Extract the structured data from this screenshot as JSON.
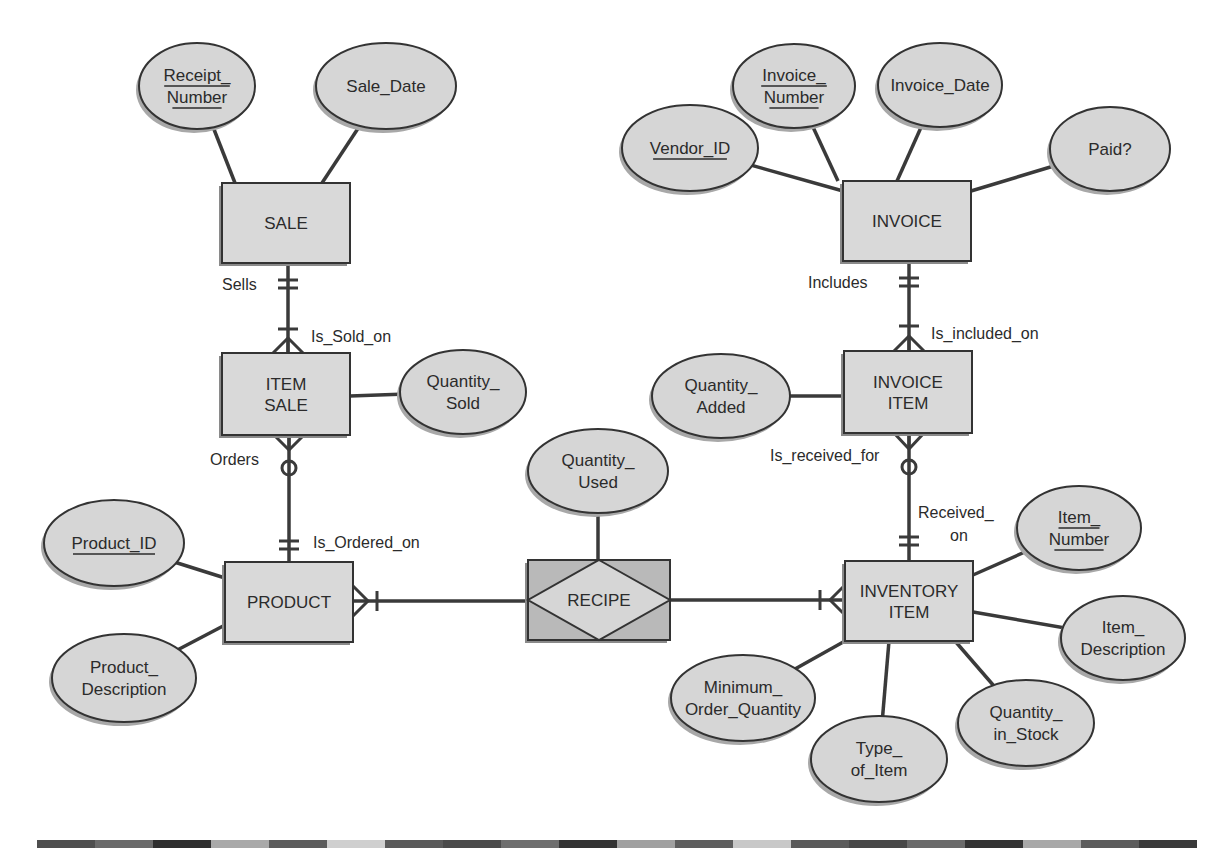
{
  "diagram": {
    "type": "entity-relationship",
    "entities": [
      {
        "id": "sale",
        "label": "SALE",
        "lines": [
          "SALE"
        ],
        "x": 222,
        "y": 183,
        "w": 128,
        "h": 80
      },
      {
        "id": "item_sale",
        "label": "ITEM SALE",
        "lines": [
          "ITEM",
          "SALE"
        ],
        "x": 222,
        "y": 353,
        "w": 128,
        "h": 82
      },
      {
        "id": "product",
        "label": "PRODUCT",
        "lines": [
          "PRODUCT"
        ],
        "x": 225,
        "y": 562,
        "w": 128,
        "h": 80
      },
      {
        "id": "invoice",
        "label": "INVOICE",
        "lines": [
          "INVOICE"
        ],
        "x": 843,
        "y": 181,
        "w": 128,
        "h": 80
      },
      {
        "id": "invoice_item",
        "label": "INVOICE ITEM",
        "lines": [
          "INVOICE",
          "ITEM"
        ],
        "x": 844,
        "y": 351,
        "w": 128,
        "h": 82
      },
      {
        "id": "inventory_item",
        "label": "INVENTORY ITEM",
        "lines": [
          "INVENTORY",
          "ITEM"
        ],
        "x": 845,
        "y": 561,
        "w": 128,
        "h": 80
      }
    ],
    "associative_entity": {
      "id": "recipe",
      "label": "RECIPE",
      "x": 528,
      "y": 560,
      "w": 142,
      "h": 80
    },
    "attributes": [
      {
        "id": "receipt_number",
        "lines": [
          "Receipt_",
          "Number"
        ],
        "key": true,
        "cx": 197,
        "cy": 86,
        "rx": 58,
        "ry": 43,
        "connects": "sale",
        "lx": 235,
        "ly": 183
      },
      {
        "id": "sale_date",
        "lines": [
          "Sale_Date"
        ],
        "key": false,
        "cx": 386,
        "cy": 86,
        "rx": 70,
        "ry": 43,
        "connects": "sale",
        "lx": 322,
        "ly": 183
      },
      {
        "id": "quantity_sold",
        "lines": [
          "Quantity_",
          "Sold"
        ],
        "key": false,
        "cx": 463,
        "cy": 392,
        "rx": 63,
        "ry": 42,
        "connects": "item_sale",
        "lx": 350,
        "ly": 396
      },
      {
        "id": "product_id",
        "lines": [
          "Product_ID"
        ],
        "key": true,
        "cx": 114,
        "cy": 543,
        "rx": 70,
        "ry": 43,
        "connects": "product",
        "lx": 225,
        "ly": 578
      },
      {
        "id": "product_description",
        "lines": [
          "Product_",
          "Description"
        ],
        "key": false,
        "cx": 124,
        "cy": 678,
        "rx": 72,
        "ry": 44,
        "connects": "product",
        "lx": 225,
        "ly": 625
      },
      {
        "id": "quantity_used",
        "lines": [
          "Quantity_",
          "Used"
        ],
        "key": false,
        "cx": 598,
        "cy": 471,
        "rx": 70,
        "ry": 42,
        "connects": "recipe",
        "lx": 598,
        "ly": 560
      },
      {
        "id": "vendor_id",
        "lines": [
          "Vendor_ID"
        ],
        "key": true,
        "cx": 690,
        "cy": 148,
        "rx": 68,
        "ry": 43,
        "connects": "invoice",
        "lx": 843,
        "ly": 191
      },
      {
        "id": "invoice_number",
        "lines": [
          "Invoice_",
          "Number"
        ],
        "key": true,
        "cx": 794,
        "cy": 86,
        "rx": 61,
        "ry": 42,
        "connects": "invoice",
        "lx": 838,
        "ly": 181
      },
      {
        "id": "invoice_date",
        "lines": [
          "Invoice_Date"
        ],
        "key": false,
        "cx": 940,
        "cy": 85,
        "rx": 62,
        "ry": 42,
        "connects": "invoice",
        "lx": 897,
        "ly": 181
      },
      {
        "id": "paid",
        "lines": [
          "Paid?"
        ],
        "key": false,
        "cx": 1110,
        "cy": 149,
        "rx": 60,
        "ry": 42,
        "connects": "invoice",
        "lx": 971,
        "ly": 191
      },
      {
        "id": "quantity_added",
        "lines": [
          "Quantity_",
          "Added"
        ],
        "key": false,
        "cx": 721,
        "cy": 396,
        "rx": 69,
        "ry": 42,
        "connects": "invoice_item",
        "lx": 844,
        "ly": 396
      },
      {
        "id": "item_number",
        "lines": [
          "Item_",
          "Number"
        ],
        "key": true,
        "cx": 1079,
        "cy": 528,
        "rx": 62,
        "ry": 42,
        "connects": "inventory_item",
        "lx": 973,
        "ly": 575
      },
      {
        "id": "item_description",
        "lines": [
          "Item_",
          "Description"
        ],
        "key": false,
        "cx": 1123,
        "cy": 638,
        "rx": 62,
        "ry": 42,
        "connects": "inventory_item",
        "lx": 973,
        "ly": 612
      },
      {
        "id": "minimum_order_quantity",
        "lines": [
          "Minimum_",
          "Order_Quantity"
        ],
        "key": false,
        "cx": 743,
        "cy": 698,
        "rx": 72,
        "ry": 43,
        "connects": "inventory_item",
        "lx": 845,
        "ly": 641
      },
      {
        "id": "quantity_in_stock",
        "lines": [
          "Quantity_",
          "in_Stock"
        ],
        "key": false,
        "cx": 1026,
        "cy": 723,
        "rx": 68,
        "ry": 43,
        "connects": "inventory_item",
        "lx": 955,
        "ly": 641
      },
      {
        "id": "type_of_item",
        "lines": [
          "Type_",
          "of_Item"
        ],
        "key": false,
        "cx": 879,
        "cy": 759,
        "rx": 68,
        "ry": 43,
        "connects": "inventory_item",
        "lx": 889,
        "ly": 641
      }
    ],
    "relationship_labels": [
      {
        "id": "sells",
        "text": "Sells",
        "x": 222,
        "y": 290,
        "anchor": "start"
      },
      {
        "id": "is_sold_on",
        "text": "Is_Sold_on",
        "x": 311,
        "y": 342,
        "anchor": "start"
      },
      {
        "id": "orders",
        "text": "Orders",
        "x": 210,
        "y": 465,
        "anchor": "start"
      },
      {
        "id": "is_ordered_on",
        "text": "Is_Ordered_on",
        "x": 313,
        "y": 548,
        "anchor": "start"
      },
      {
        "id": "includes",
        "text": "Includes",
        "x": 808,
        "y": 288,
        "anchor": "start"
      },
      {
        "id": "is_included_on",
        "text": "Is_included_on",
        "x": 931,
        "y": 339,
        "anchor": "start"
      },
      {
        "id": "is_received_for",
        "text": "Is_received_for",
        "x": 770,
        "y": 461,
        "anchor": "start"
      },
      {
        "id": "received_on_1",
        "text": "Received_",
        "x": 918,
        "y": 518,
        "anchor": "start"
      },
      {
        "id": "received_on_2",
        "text": "on",
        "x": 950,
        "y": 541,
        "anchor": "start"
      }
    ],
    "relationships": [
      {
        "from": "sale",
        "to": "item_sale",
        "from_card": "one-and-only-one",
        "to_card": "one-or-many",
        "from_label": "Sells",
        "to_label": "Is_Sold_on"
      },
      {
        "from": "item_sale",
        "to": "product",
        "from_card": "zero-or-many",
        "to_card": "one-and-only-one",
        "from_label": "Orders",
        "to_label": "Is_Ordered_on"
      },
      {
        "from": "invoice",
        "to": "invoice_item",
        "from_card": "one-and-only-one",
        "to_card": "one-or-many",
        "from_label": "Includes",
        "to_label": "Is_included_on"
      },
      {
        "from": "invoice_item",
        "to": "inventory_item",
        "from_card": "zero-or-many",
        "to_card": "one-and-only-one",
        "from_label": "Is_received_for",
        "to_label": "Received_on"
      },
      {
        "from": "product",
        "to": "recipe",
        "from_card": "one-or-many",
        "to_card": "none"
      },
      {
        "from": "recipe",
        "to": "inventory_item",
        "from_card": "none",
        "to_card": "one-or-many"
      }
    ]
  },
  "footer_bar": {
    "x_start": 37,
    "segment_width": 58,
    "colors": [
      "#4e4e4e",
      "#6a6a6a",
      "#2e2e2e",
      "#a9a9a9",
      "#5c5c5c",
      "#cfcfcf",
      "#5a5a5a",
      "#4a4a4a",
      "#6e6e6e",
      "#333333",
      "#a0a0a0",
      "#5e5e5e",
      "#c8c8c8",
      "#5a5a5a",
      "#474747",
      "#6a6a6a",
      "#333333",
      "#a8a8a8",
      "#5c5c5c",
      "#3a3a3a"
    ]
  },
  "colors": {
    "entity_fill": "#d9d9d9",
    "attribute_fill": "#d6d6d6",
    "associative_fill": "#b9b9b9",
    "line": "#3a3a3a",
    "text": "#2b2b2b"
  }
}
